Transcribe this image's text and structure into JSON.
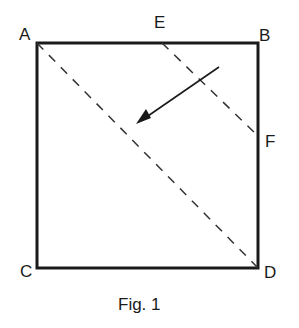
{
  "figure": {
    "caption": "Fig. 1",
    "colors": {
      "stroke": "#1a1a1a",
      "background": "#ffffff"
    },
    "points": {
      "A": {
        "label": "A",
        "x": 37,
        "y": 43
      },
      "B": {
        "label": "B",
        "x": 258,
        "y": 43
      },
      "C": {
        "label": "C",
        "x": 37,
        "y": 268
      },
      "D": {
        "label": "D",
        "x": 258,
        "y": 268
      },
      "E": {
        "label": "E",
        "x": 162,
        "y": 43
      },
      "F": {
        "label": "F",
        "x": 258,
        "y": 136
      }
    },
    "square": [
      "A",
      "B",
      "D",
      "C"
    ],
    "dashed_lines": [
      [
        "A",
        "D"
      ],
      [
        "E",
        "F"
      ]
    ],
    "arrow": {
      "from": [
        219,
        67
      ],
      "to": [
        136,
        124
      ],
      "direction": "fold-toward-diagonal"
    }
  }
}
